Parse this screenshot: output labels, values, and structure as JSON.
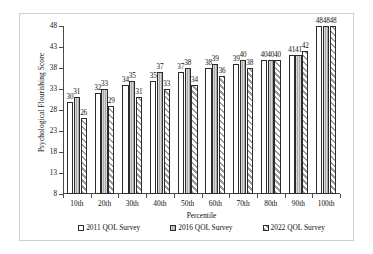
{
  "chart_data": {
    "type": "bar",
    "title": "",
    "xlabel": "Percentile",
    "ylabel": "Psychological Flourishing Score",
    "ylim": [
      8,
      48
    ],
    "yticks": [
      8,
      13,
      18,
      23,
      28,
      33,
      38,
      43,
      48
    ],
    "grid": false,
    "legend_position": "bottom",
    "categories": [
      "10th",
      "20th",
      "30th",
      "40th",
      "50th",
      "60th",
      "70th",
      "80th",
      "90th",
      "100th"
    ],
    "series": [
      {
        "name": "2011 QOL Survey",
        "pattern": "white-outline",
        "color": "#ffffff",
        "values": [
          30,
          32,
          34,
          35,
          37,
          38,
          39,
          40,
          41,
          48
        ]
      },
      {
        "name": "2016 QOL Survey",
        "pattern": "solid-gray",
        "color": "#a9a9a9",
        "values": [
          31,
          33,
          35,
          37,
          38,
          39,
          40,
          40,
          41,
          48
        ]
      },
      {
        "name": "2022 QOL Survey",
        "pattern": "diagonal-hatch",
        "color": "#9b9b9b",
        "values": [
          26,
          29,
          31,
          33,
          34,
          36,
          38,
          40,
          42,
          48
        ]
      }
    ]
  },
  "axis_colors": {
    "axis_line": "#4a4a4a",
    "bar_outline": "#2b2b2b",
    "frame_border": "#cfcfcf",
    "text": "#111111"
  }
}
